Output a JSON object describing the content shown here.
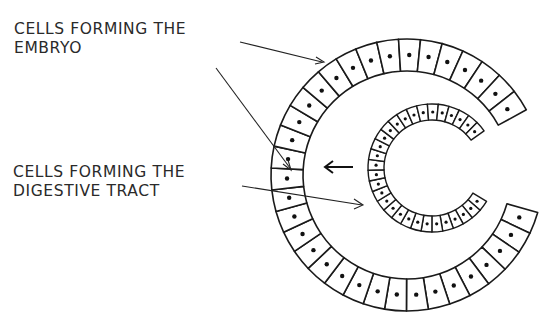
{
  "diagram": {
    "labels": [
      {
        "id": "embryo-cells",
        "line1": "CELLS FORMING THE",
        "line2": "EMBRYO"
      },
      {
        "id": "digestive-cells",
        "line1": "CELLS FORMING THE",
        "line2": "DIGESTIVE TRACT"
      }
    ],
    "structures": {
      "outer_layer": "outer ring of large cells with dark nuclei",
      "inner_layer": "invaginated inner layer of smaller cells",
      "arrow": "left-pointing arrow showing direction of invagination"
    },
    "colors": {
      "ink": "#1a1a1a",
      "background": "#ffffff"
    }
  }
}
